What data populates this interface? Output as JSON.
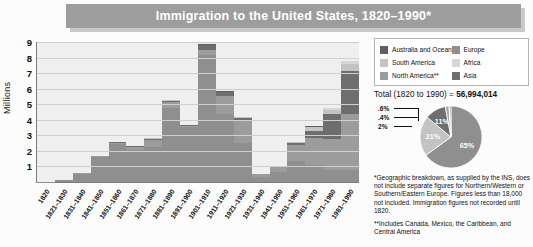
{
  "title": "Immigration to the United States, 1820–1990*",
  "axis": {
    "ylabel": "Millions",
    "yticks": [
      "9",
      "8",
      "7",
      "6",
      "5",
      "4",
      "3",
      "2",
      "1"
    ]
  },
  "legend": {
    "left": [
      {
        "label": "Australia and Oceania",
        "color": "#5f5f5f"
      },
      {
        "label": "South America",
        "color": "#c3c3c3"
      },
      {
        "label": "North America**",
        "color": "#9c9c9c"
      }
    ],
    "right": [
      {
        "label": "Europe",
        "color": "#8f8f8f"
      },
      {
        "label": "Africa",
        "color": "#d6d6d6"
      },
      {
        "label": "Asia",
        "color": "#6e6e6e"
      }
    ]
  },
  "total": {
    "prefix": "Total (1820 to 1990) = ",
    "value": "56,994,014"
  },
  "notes": {
    "note1_star": "*",
    "note1": "Geographic breakdown, as supplied by the INS, does not include separate figures for Northern/Western or Southern/Eastern Europe. Figures less than 18,000 not included. Immigration figures not recorded until 1820.",
    "note2_star": "**",
    "note2": "Includes Canada, Mexico, the Caribbean, and Central America"
  },
  "chart_data": [
    {
      "type": "bar",
      "title": "Immigration to the United States, 1820–1990*",
      "xlabel": "",
      "ylabel": "Millions",
      "ylim": [
        0,
        9
      ],
      "grid": true,
      "stacked": true,
      "legend_position": "right",
      "categories": [
        "1820",
        "1821–1830",
        "1831–1840",
        "1841–1850",
        "1851–1860",
        "1861–1870",
        "1871–1880",
        "1881–1890",
        "1891–1900",
        "1901–1910",
        "1911–1920",
        "1921–1930",
        "1931–1940",
        "1941–1950",
        "1951–1960",
        "1961–1970",
        "1971–1980",
        "1981–1990"
      ],
      "series": [
        {
          "name": "Europe",
          "color": "#8f8f8f",
          "values": [
            0.008,
            0.1,
            0.5,
            1.6,
            2.45,
            2.06,
            2.27,
            4.74,
            3.56,
            8.14,
            4.38,
            2.48,
            0.35,
            0.62,
            1.33,
            1.12,
            0.8,
            0.76
          ]
        },
        {
          "name": "North America**",
          "color": "#9c9c9c",
          "values": [
            0.002,
            0.04,
            0.08,
            0.06,
            0.08,
            0.17,
            0.4,
            0.43,
            0.04,
            0.36,
            1.14,
            1.52,
            0.16,
            0.36,
            1.02,
            1.72,
            1.98,
            3.62
          ]
        },
        {
          "name": "Asia",
          "color": "#6e6e6e",
          "values": [
            0.0,
            0.0,
            0.0,
            0.0,
            0.04,
            0.06,
            0.12,
            0.07,
            0.07,
            0.32,
            0.25,
            0.11,
            0.02,
            0.04,
            0.15,
            0.43,
            1.59,
            2.74
          ]
        },
        {
          "name": "South America",
          "color": "#c3c3c3",
          "values": [
            0.0,
            0.0,
            0.0,
            0.0,
            0.0,
            0.0,
            0.01,
            0.01,
            0.01,
            0.01,
            0.04,
            0.04,
            0.01,
            0.02,
            0.08,
            0.26,
            0.28,
            0.46
          ]
        },
        {
          "name": "Africa",
          "color": "#d6d6d6",
          "values": [
            0.0,
            0.0,
            0.0,
            0.0,
            0.0,
            0.0,
            0.0,
            0.0,
            0.0,
            0.01,
            0.01,
            0.01,
            0.0,
            0.01,
            0.01,
            0.03,
            0.08,
            0.18
          ]
        },
        {
          "name": "Australia and Oceania",
          "color": "#5f5f5f",
          "values": [
            0.0,
            0.0,
            0.0,
            0.0,
            0.0,
            0.0,
            0.01,
            0.01,
            0.01,
            0.01,
            0.01,
            0.01,
            0.0,
            0.01,
            0.01,
            0.03,
            0.04,
            0.04
          ]
        }
      ],
      "totals": [
        0.01,
        0.15,
        0.6,
        1.7,
        2.6,
        2.3,
        2.8,
        5.25,
        3.7,
        8.8,
        5.7,
        4.1,
        0.53,
        1.04,
        2.5,
        3.3,
        4.5,
        7.3
      ]
    },
    {
      "type": "pie",
      "title": "Total (1820 to 1990) = 56,994,014",
      "labels": [
        "Europe",
        "North America**",
        "Asia",
        "South America",
        "Africa",
        "Australia and Oceania"
      ],
      "values": [
        65,
        21,
        11,
        2,
        0.4,
        0.6
      ],
      "display_labels": [
        "65%",
        "21%",
        "11%",
        "2%",
        ".4%",
        ".6%"
      ],
      "colors": [
        "#8f8f8f",
        "#c3c3c3",
        "#6e6e6e",
        "#a8a8a8",
        "#d6d6d6",
        "#5f5f5f"
      ],
      "legend_position": "top"
    }
  ]
}
